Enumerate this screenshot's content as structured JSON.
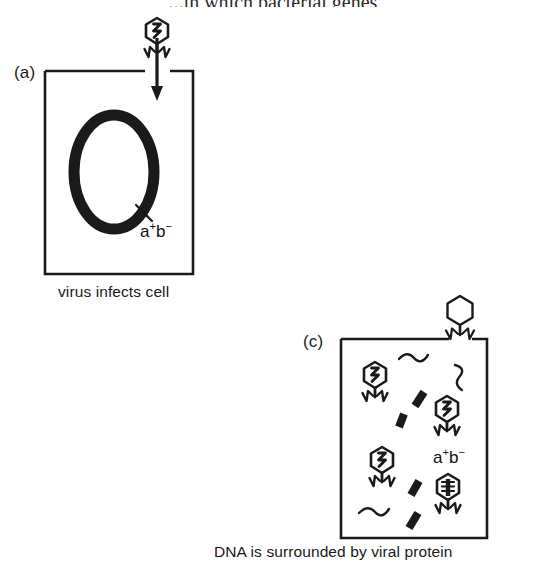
{
  "figure": {
    "top_cut_text": "...in which bacterial genes",
    "background_color": "#ffffff",
    "ink_color": "#1a1a1a"
  },
  "panel_a": {
    "label": "(a)",
    "caption": "virus infects cell",
    "genotype": "a",
    "genotype_sup1": "+",
    "genotype_letter2": "b",
    "genotype_sup2": "−",
    "elements": {
      "cell_box": "bacterial-cell-outline",
      "chromosome": "circular-bacterial-chromosome",
      "marker_hashes": "gene-marker-hatch",
      "phage": "bacteriophage-attached",
      "injection_arrow": "dna-injection-arrow"
    }
  },
  "panel_c": {
    "label": "(c)",
    "caption": "DNA is surrounded by viral protein",
    "genotype": "a",
    "genotype_sup1": "+",
    "genotype_letter2": "b",
    "genotype_sup2": "−",
    "elements": {
      "cell_box": "lysing-bacterial-cell-outline",
      "empty_phage_outside": "empty-phage-coat",
      "assembled_phages": "phage-particle-with-viral-dna",
      "transducing_particle": "transducing-particle-with-bacterial-dna",
      "dna_fragments": "bacterial-dna-fragment",
      "viral_proteins": "viral-protein-squiggle"
    },
    "counts": {
      "phages_with_viral_dna": 3,
      "transducing_particles": 1,
      "dna_fragments": 4,
      "protein_squiggles": 3
    }
  }
}
